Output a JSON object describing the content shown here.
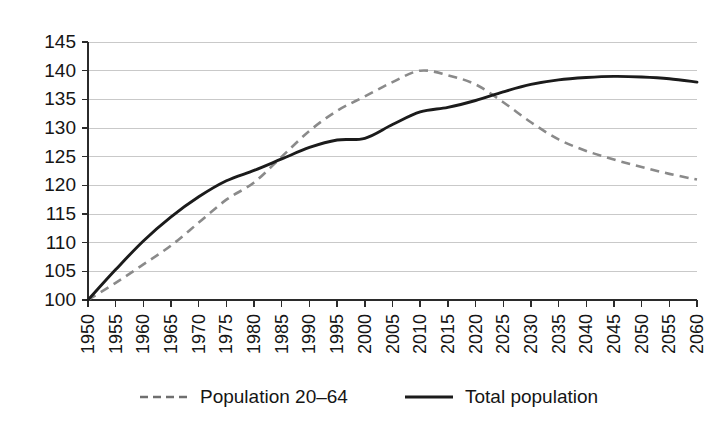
{
  "chart_data": {
    "type": "line",
    "title": "",
    "subtitle": "",
    "xlabel": "",
    "ylabel": "",
    "xlim": [
      1950,
      2060
    ],
    "ylim": [
      100,
      145
    ],
    "grid": true,
    "grid_axis": "y",
    "legend_position": "bottom",
    "x": [
      1950,
      1955,
      1960,
      1965,
      1970,
      1975,
      1980,
      1985,
      1990,
      1995,
      2000,
      2005,
      2010,
      2015,
      2020,
      2025,
      2030,
      2035,
      2040,
      2045,
      2050,
      2055,
      2060
    ],
    "categories": [
      "1950",
      "1955",
      "1960",
      "1965",
      "1970",
      "1975",
      "1980",
      "1985",
      "1990",
      "1995",
      "2000",
      "2005",
      "2010",
      "2015",
      "2020",
      "2025",
      "2030",
      "2035",
      "2040",
      "2045",
      "2050",
      "2055",
      "2060"
    ],
    "ytick_values": [
      100,
      105,
      110,
      115,
      120,
      125,
      130,
      135,
      140,
      145
    ],
    "ytick_labels": [
      "100",
      "105",
      "110",
      "115",
      "120",
      "125",
      "130",
      "135",
      "140",
      "145"
    ],
    "series": [
      {
        "name": "Population 20–64",
        "style": "dashed",
        "color": "#8a8a8a",
        "values": [
          100.0,
          103.0,
          106.2,
          109.5,
          113.5,
          117.5,
          120.5,
          125.0,
          129.5,
          133.0,
          135.5,
          138.0,
          140.0,
          139.2,
          137.6,
          134.5,
          131.0,
          128.0,
          126.0,
          124.5,
          123.2,
          122.0,
          121.0
        ]
      },
      {
        "name": "Total population",
        "style": "solid",
        "color": "#1b1b1b",
        "values": [
          100.0,
          105.3,
          110.3,
          114.5,
          118.0,
          120.8,
          122.6,
          124.6,
          126.6,
          127.9,
          128.2,
          130.6,
          132.8,
          133.6,
          134.8,
          136.3,
          137.6,
          138.4,
          138.8,
          139.0,
          138.9,
          138.6,
          138.0
        ]
      }
    ]
  },
  "legend": {
    "items": [
      {
        "label": "Population 20–64",
        "style": "dashed"
      },
      {
        "label": "Total population",
        "style": "solid"
      }
    ]
  }
}
